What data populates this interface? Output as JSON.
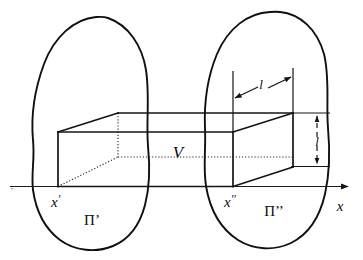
{
  "figure": {
    "background_color": "#ffffff",
    "ink_color": "#101010",
    "width": 363,
    "height": 260
  },
  "axis": {
    "name": "x-axis",
    "label": "x",
    "orientation": "horizontal",
    "arrow_direction": "right",
    "y_position": 186,
    "x_start": 10,
    "x_end": 350
  },
  "labels": {
    "volume": "V",
    "left_station": "x",
    "left_station_prime": "′",
    "right_station": "x",
    "right_station_prime": "′′",
    "left_plane": "Π",
    "left_plane_prime": "’",
    "right_plane": "Π",
    "right_plane_prime": "’’",
    "axis_label": "x",
    "dim_horizontal": "l",
    "dim_vertical": "l"
  },
  "regions": [
    {
      "name": "left-region",
      "label": "Π’",
      "station_label": "x′",
      "description": "closed irregular blob outline around left cross-section"
    },
    {
      "name": "right-region",
      "label": "Π’’",
      "station_label": "x′′",
      "description": "closed irregular blob outline around right cross-section"
    }
  ],
  "solid": {
    "name": "rectangular-box",
    "label": "V",
    "description": "wireframe rectangular parallelepiped in oblique projection",
    "hidden_edges_style": "dotted",
    "visible_edges_style": "solid"
  },
  "dimensions": [
    {
      "name": "horizontal-dimension",
      "label": "l",
      "orientation": "horizontal",
      "arrow_style": "double-headed-outward",
      "description": "depth of box measured along receding direction"
    },
    {
      "name": "vertical-dimension",
      "label": "l",
      "orientation": "vertical",
      "arrow_style": "double-headed",
      "line_style": "dashed",
      "description": "height of box at right face"
    }
  ]
}
